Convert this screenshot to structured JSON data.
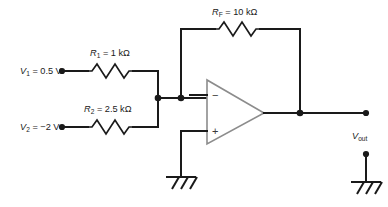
{
  "diagram": {
    "colors": {
      "wire": "#1a1a1a",
      "opamp_outline": "#8c8c8c",
      "background": "#ffffff"
    }
  },
  "inputs": [
    {
      "source_label": "V",
      "source_sub": "1",
      "source_value": "= 0.5 V",
      "resistor_label": "R",
      "resistor_sub": "1",
      "resistor_value": "= 1 kΩ"
    },
    {
      "source_label": "V",
      "source_sub": "2",
      "source_value": "= −2 V",
      "resistor_label": "R",
      "resistor_sub": "2",
      "resistor_value": "= 2.5 kΩ"
    }
  ],
  "feedback": {
    "resistor_label": "R",
    "resistor_sub": "F",
    "resistor_value": "= 10 kΩ"
  },
  "opamp": {
    "inverting_sign": "−",
    "noninverting_sign": "+"
  },
  "output": {
    "label": "V",
    "sub": "out"
  },
  "grounds": [
    {
      "name": "noninverting-input-ground"
    },
    {
      "name": "output-reference-ground"
    }
  ]
}
